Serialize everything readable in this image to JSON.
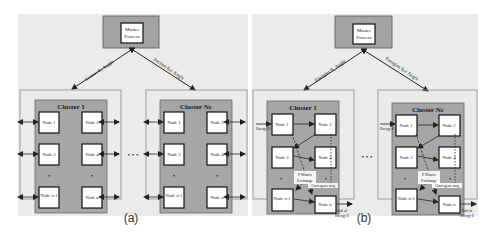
{
  "colors": {
    "panel_bg": "#ebebeb",
    "outer_cluster_border": "#8a8a8a",
    "inner_cluster_fill": "#a6a6a6",
    "master_fill": "#a3a3a3",
    "node_fill": "#ffffff",
    "node_border": "#222222",
    "arrow": "#222222"
  },
  "panel_a": {
    "caption": "(a)",
    "master": {
      "line1": "Master",
      "line2": "Process"
    },
    "edge_left_label": "Sectors θ₁ Angle",
    "edge_right_label": "Sectors θₙc Angle",
    "clusters": [
      {
        "title": "Cluster 1",
        "nodes": [
          "Node 1",
          "Node 2",
          "Node 3",
          "Node 4",
          "Node n-1",
          "Node n"
        ],
        "dots": "•"
      },
      {
        "title": "Cluster Nc",
        "nodes": [
          "Node 1",
          "Node 2",
          "Node 3",
          "Node 4",
          "Node n-1",
          "Node n"
        ],
        "dots": "•"
      }
    ],
    "ellipsis": "• • •"
  },
  "panel_b": {
    "caption": "(b)",
    "master": {
      "line1": "Master",
      "line2": "Process"
    },
    "edge_left_label": "Energies θ₁ Angle",
    "edge_right_label": "Energies θₙc Angle",
    "clusters": [
      {
        "title": "Cluster 1",
        "nodes": [
          "Node 1",
          "Node 2",
          "Node 3",
          "Node 4",
          "Node n-1",
          "Node n"
        ],
        "energy_in": "Energy E",
        "energy_out_1": "End of",
        "energy_out_2": "Energy E",
        "pmatrix_1": "P Matrix",
        "pmatrix_2": "Exchange",
        "convergence": "Convergence msg"
      },
      {
        "title": "Cluster Nc",
        "nodes": [
          "Node 1",
          "Node 2",
          "Node 3",
          "Node 4",
          "Node n-1",
          "Node n"
        ],
        "energy_in": "Energy E",
        "energy_out_1": "End of",
        "energy_out_2": "Energy E",
        "pmatrix_1": "P Matrix",
        "pmatrix_2": "Exchange",
        "convergence": "Convergence msg"
      }
    ],
    "ellipsis": "• • •"
  }
}
